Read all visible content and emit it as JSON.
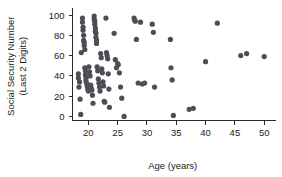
{
  "chart_data": {
    "type": "scatter",
    "title": "",
    "xlabel": "Age (years)",
    "ylabel": "Social Security Number\n(Last 2 Digits)",
    "ylabel_line1": "Social Security Number",
    "ylabel_line2": "(Last 2 Digits)",
    "xlim": [
      17.3,
      51.5
    ],
    "ylim": [
      -4,
      103
    ],
    "xticks": [
      20,
      25,
      30,
      35,
      40,
      45,
      50
    ],
    "xtick_labels": [
      "20",
      "25",
      "30",
      "35",
      "40",
      "45",
      "50"
    ],
    "yticks": [
      0,
      20,
      40,
      60,
      80,
      100
    ],
    "ytick_labels": [
      "0",
      "20",
      "40",
      "60",
      "80",
      "100"
    ],
    "grid": false,
    "legend": false,
    "marker": "circle",
    "marker_color": "#4d4d55",
    "marker_size": 2.6,
    "n_points": 97,
    "points": [
      [
        18.3,
        42
      ],
      [
        18.3,
        38
      ],
      [
        18.4,
        29
      ],
      [
        18.5,
        34
      ],
      [
        18.6,
        17
      ],
      [
        18.7,
        2
      ],
      [
        18.8,
        63
      ],
      [
        19.0,
        97
      ],
      [
        19.0,
        93
      ],
      [
        19.1,
        88
      ],
      [
        19.1,
        85
      ],
      [
        19.2,
        80
      ],
      [
        19.2,
        75
      ],
      [
        19.3,
        73
      ],
      [
        19.3,
        70
      ],
      [
        19.4,
        66
      ],
      [
        19.4,
        48
      ],
      [
        19.5,
        45
      ],
      [
        19.5,
        41
      ],
      [
        19.6,
        38
      ],
      [
        19.6,
        35
      ],
      [
        19.7,
        33
      ],
      [
        19.8,
        30
      ],
      [
        19.9,
        27
      ],
      [
        20.0,
        25
      ],
      [
        20.1,
        49
      ],
      [
        20.2,
        44
      ],
      [
        20.3,
        40
      ],
      [
        20.4,
        31
      ],
      [
        20.5,
        28
      ],
      [
        20.6,
        26
      ],
      [
        20.7,
        21
      ],
      [
        20.8,
        13
      ],
      [
        21.0,
        99
      ],
      [
        21.0,
        96
      ],
      [
        21.1,
        94
      ],
      [
        21.1,
        91
      ],
      [
        21.2,
        87
      ],
      [
        21.2,
        84
      ],
      [
        21.3,
        82
      ],
      [
        21.3,
        78
      ],
      [
        21.4,
        75
      ],
      [
        21.4,
        72
      ],
      [
        21.5,
        49
      ],
      [
        21.6,
        45
      ],
      [
        21.7,
        37
      ],
      [
        21.8,
        33
      ],
      [
        21.9,
        29
      ],
      [
        22.0,
        25
      ],
      [
        22.1,
        62
      ],
      [
        22.2,
        58
      ],
      [
        22.3,
        47
      ],
      [
        22.4,
        43
      ],
      [
        22.5,
        34
      ],
      [
        22.6,
        30
      ],
      [
        22.7,
        15
      ],
      [
        22.8,
        14
      ],
      [
        23.0,
        97
      ],
      [
        23.1,
        63
      ],
      [
        23.2,
        60
      ],
      [
        23.3,
        57
      ],
      [
        23.4,
        42
      ],
      [
        23.5,
        27
      ],
      [
        23.6,
        9
      ],
      [
        24.4,
        82
      ],
      [
        24.6,
        56
      ],
      [
        24.8,
        48
      ],
      [
        25.0,
        52
      ],
      [
        25.1,
        51
      ],
      [
        25.3,
        43
      ],
      [
        25.5,
        29
      ],
      [
        25.7,
        18
      ],
      [
        26.1,
        0
      ],
      [
        27.8,
        97
      ],
      [
        27.9,
        95
      ],
      [
        28.0,
        94
      ],
      [
        28.2,
        76
      ],
      [
        28.5,
        33
      ],
      [
        28.9,
        93
      ],
      [
        29.2,
        32
      ],
      [
        29.6,
        33
      ],
      [
        30.9,
        91
      ],
      [
        31.1,
        83
      ],
      [
        31.3,
        29
      ],
      [
        34.0,
        76
      ],
      [
        34.1,
        48
      ],
      [
        34.3,
        36
      ],
      [
        34.5,
        1
      ],
      [
        37.2,
        7
      ],
      [
        37.9,
        8
      ],
      [
        40.0,
        54
      ],
      [
        42.0,
        92
      ],
      [
        46.0,
        60
      ],
      [
        47.0,
        62
      ],
      [
        50.0,
        59
      ]
    ]
  },
  "figure": {
    "background_color": "#ffffff",
    "axis_color": "#2b2b2b",
    "text_color": "#1a1a1a"
  }
}
